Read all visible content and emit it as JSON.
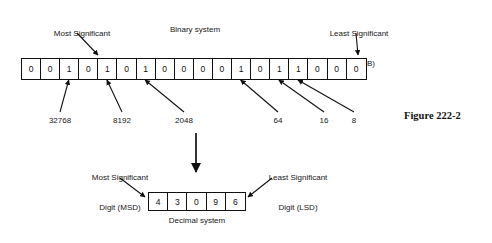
{
  "figure": {
    "caption": "Figure 222-2",
    "binary_title": "Binary system",
    "decimal_title": "Decimal system",
    "msb_label_line1": "Most Significant",
    "msb_label_line2": "Bit (MSB)",
    "lsb_label_line1": "Least Significant",
    "lsb_label_line2": "Bit (LSB)",
    "msd_label_line1": "Most Significant",
    "msd_label_line2": "Digit (MSD)",
    "lsd_label_line1": "Least Significant",
    "lsd_label_line2": "Digit (LSD)"
  },
  "binary": {
    "bits": [
      "0",
      "0",
      "1",
      "0",
      "1",
      "0",
      "1",
      "0",
      "0",
      "0",
      "0",
      "1",
      "0",
      "1",
      "1",
      "0",
      "0",
      "0"
    ],
    "bit_count": 18,
    "value_string": "001010100001011000"
  },
  "decimal": {
    "digits": [
      "4",
      "3",
      "0",
      "9",
      "6"
    ],
    "value_string": "43096"
  },
  "weights": [
    {
      "label": "32768",
      "bit_index": 2
    },
    {
      "label": "8192",
      "bit_index": 4
    },
    {
      "label": "2048",
      "bit_index": 6
    },
    {
      "label": "64",
      "bit_index": 11
    },
    {
      "label": "16",
      "bit_index": 13
    },
    {
      "label": "8",
      "bit_index": 14
    }
  ],
  "colors": {
    "ink": "#111111",
    "paper": "#ffffff"
  }
}
